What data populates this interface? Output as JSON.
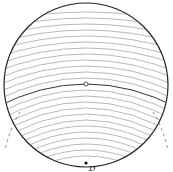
{
  "diagram": {
    "type": "field-lines-in-disk",
    "circle": {
      "cx": 86,
      "cy": 85,
      "r": 82,
      "stroke": "#222222"
    },
    "center_point": {
      "x": 86,
      "y": 84,
      "style": "hollow"
    },
    "bottom_point": {
      "x": 86,
      "y": 163,
      "style": "solid",
      "label": "D"
    },
    "line_color": "#9a9a9a",
    "emphasis_color": "#333333",
    "dashed_color": "#777777",
    "curve_y_at_center": [
      12,
      18,
      24,
      30,
      36,
      42,
      48,
      54,
      60,
      66,
      72,
      78,
      84,
      90,
      96,
      102,
      108,
      114,
      120,
      126,
      132,
      138,
      144,
      150,
      156
    ],
    "emphasized_index": 12
  }
}
